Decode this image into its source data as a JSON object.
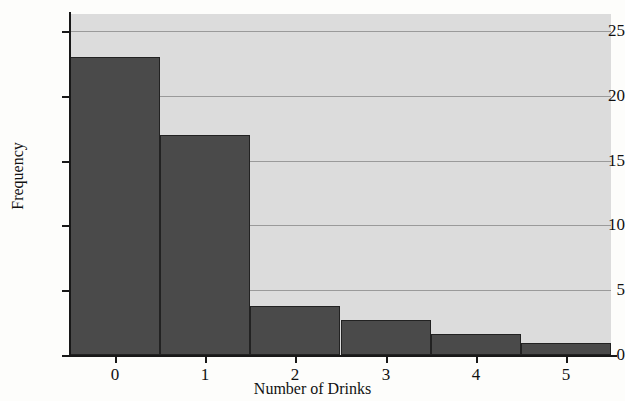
{
  "chart_data": {
    "type": "bar",
    "title": "",
    "xlabel": "Number of Drinks",
    "ylabel": "Frequency",
    "categories": [
      "0",
      "1",
      "2",
      "3",
      "4",
      "5"
    ],
    "values": [
      23,
      17,
      3.8,
      2.7,
      1.6,
      0.9
    ],
    "series": [
      {
        "name": "Frequency",
        "values": [
          23,
          17,
          3.8,
          2.7,
          1.6,
          0.9
        ]
      }
    ],
    "ylim": [
      0,
      26.3
    ],
    "xlim": [
      -0.5,
      5.5
    ],
    "yticks": [
      "0",
      "5",
      "10",
      "15",
      "20",
      "25"
    ],
    "ytick_values": [
      0,
      5,
      10,
      15,
      20,
      25
    ],
    "xticks": [
      "0",
      "1",
      "2",
      "3",
      "4",
      "5"
    ],
    "grid": "horizontal",
    "legend": "none",
    "colors": {
      "bar_fill": "#4a4a4a",
      "bar_edge": "#222222",
      "plot_background": "#dcdcdc",
      "gridline": "#9a9a9a",
      "axis": "#181818",
      "figure_background": "#fdfdfb",
      "text": "#111111"
    }
  }
}
